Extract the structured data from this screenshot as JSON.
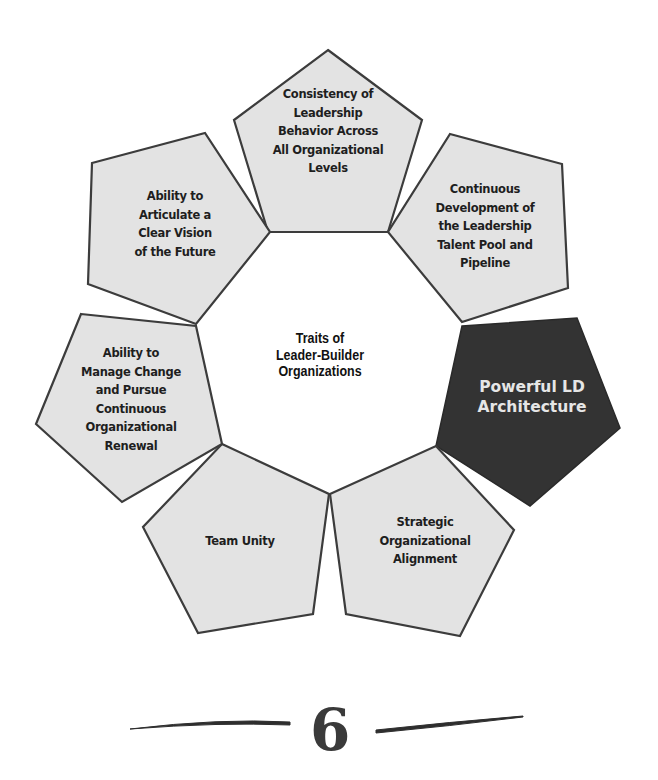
{
  "diagram": {
    "center_title": "Traits of\nLeader-Builder\nOrganizations",
    "colors": {
      "pentagon_fill": "#e3e3e3",
      "pentagon_stroke": "#3c3c3c",
      "highlight_fill": "#333333",
      "highlight_text": "#e6e6e6",
      "text": "#1e1e1e"
    },
    "traits": [
      {
        "id": "top",
        "label": "Consistency of\nLeadership\nBehavior Across\nAll Organizational\nLevels",
        "highlighted": false
      },
      {
        "id": "top-right",
        "label": "Continuous\nDevelopment of\nthe Leadership\nTalent Pool and\nPipeline",
        "highlighted": false
      },
      {
        "id": "right",
        "label": "Powerful LD\nArchitecture",
        "highlighted": true
      },
      {
        "id": "bottom-right",
        "label": "Strategic\nOrganizational\nAlignment",
        "highlighted": false
      },
      {
        "id": "bottom-left",
        "label": "Team Unity",
        "highlighted": false
      },
      {
        "id": "left",
        "label": "Ability to\nManage Change\nand Pursue\nContinuous\nOrganizational\nRenewal",
        "highlighted": false
      },
      {
        "id": "top-left",
        "label": "Ability to\nArticulate a\nClear Vision\nof the Future",
        "highlighted": false
      }
    ]
  },
  "page": {
    "number": "6"
  }
}
